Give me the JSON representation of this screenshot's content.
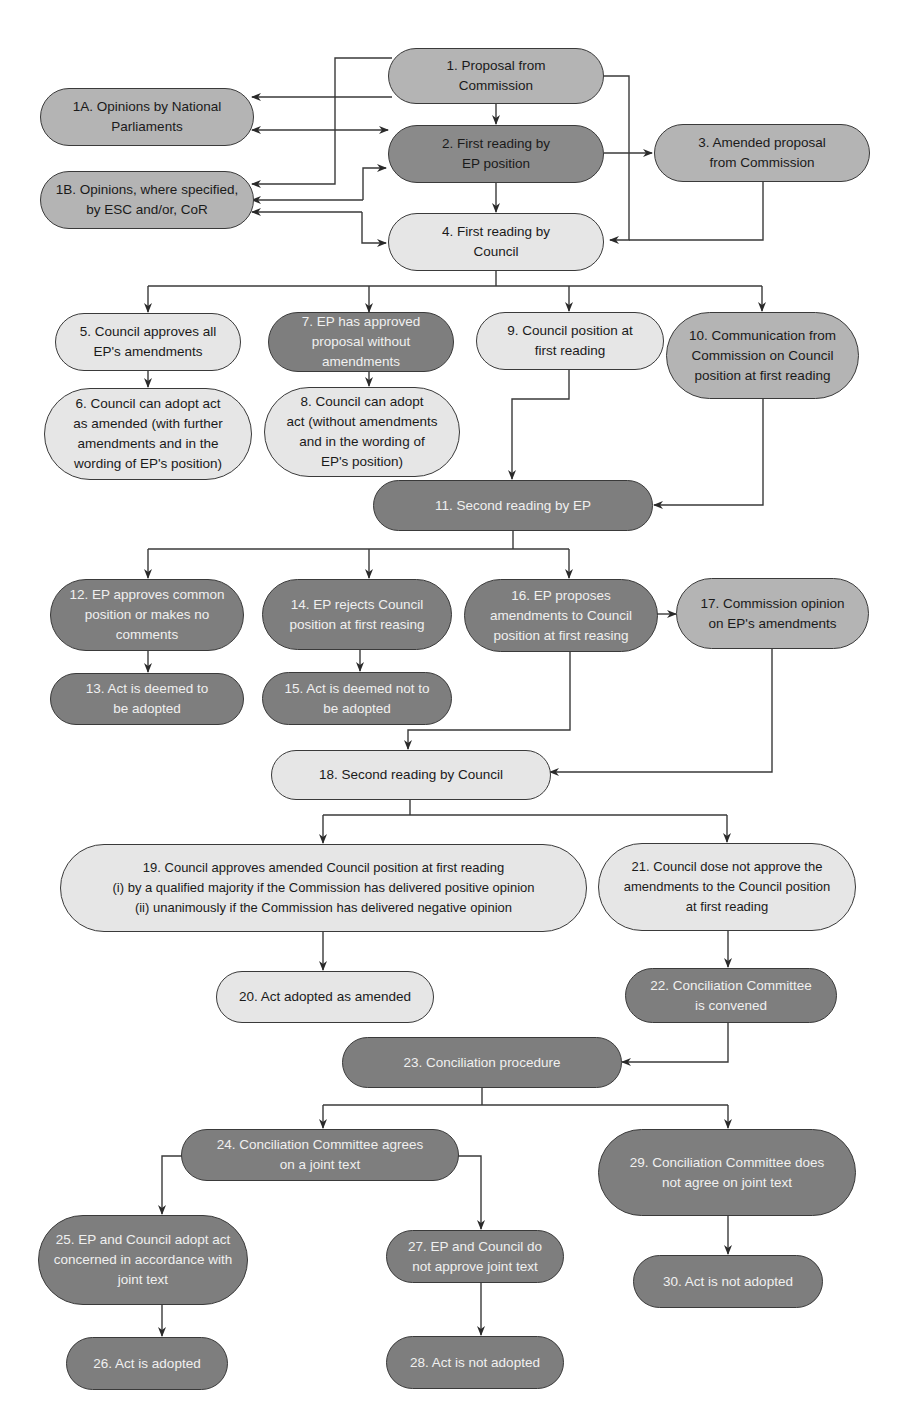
{
  "colors": {
    "light": "#e6e6e6",
    "mid": "#b4b4b4",
    "dark": "#7e7e7e",
    "line": "#3a3a3a"
  },
  "nodes": {
    "n1": "1. Proposal from\nCommission",
    "n1a": "1A. Opinions by National\nParliaments",
    "n1b": "1B. Opinions, where specified,\nby ESC and/or, CoR",
    "n2": "2. First reading by\nEP position",
    "n3": "3. Amended proposal\nfrom Commission",
    "n4": "4. First reading by\nCouncil",
    "n5": "5. Council approves all\nEP's amendments",
    "n6": "6. Council can adopt act\nas amended (with further\namendments and in the\nwording of EP's position)",
    "n7": "7. EP has approved\nproposal without\namendments",
    "n8": "8. Council can adopt\nact (without amendments\nand in the wording of\nEP's position)",
    "n9": "9. Council position at\nfirst reading",
    "n10": "10. Communication from\nCommission on Council\nposition at first reading",
    "n11": "11. Second reading by EP",
    "n12": "12. EP approves common\nposition or makes no\ncomments",
    "n13": "13. Act is deemed to\nbe adopted",
    "n14": "14. EP rejects Council\nposition at first reasing",
    "n15": "15. Act is deemed not to\nbe adopted",
    "n16": "16. EP proposes\namendments to Council\nposition at first reasing",
    "n17": "17. Commission opinion\non EP's amendments",
    "n18": "18. Second reading by Council",
    "n19": "19. Council approves amended Council position at first reading\n(i) by a qualified majority if the Commission has delivered positive opinion\n(ii) unanimously if the Commission has delivered negative opinion",
    "n20": "20. Act adopted as amended",
    "n21": "21. Council dose not approve the\namendments  to the Council position\nat first reading",
    "n22": "22. Conciliation Committee\nis convened",
    "n23": "23. Conciliation procedure",
    "n24": "24. Conciliation Committee agrees\non a joint text",
    "n25": "25. EP and Council adopt act\nconcerned in accordance with\njoint text",
    "n26": "26. Act is adopted",
    "n27": "27. EP and Council do\nnot approve joint text",
    "n28": "28. Act is not adopted",
    "n29": "29. Conciliation Committee does\nnot agree on joint text",
    "n30": "30. Act is not adopted"
  }
}
